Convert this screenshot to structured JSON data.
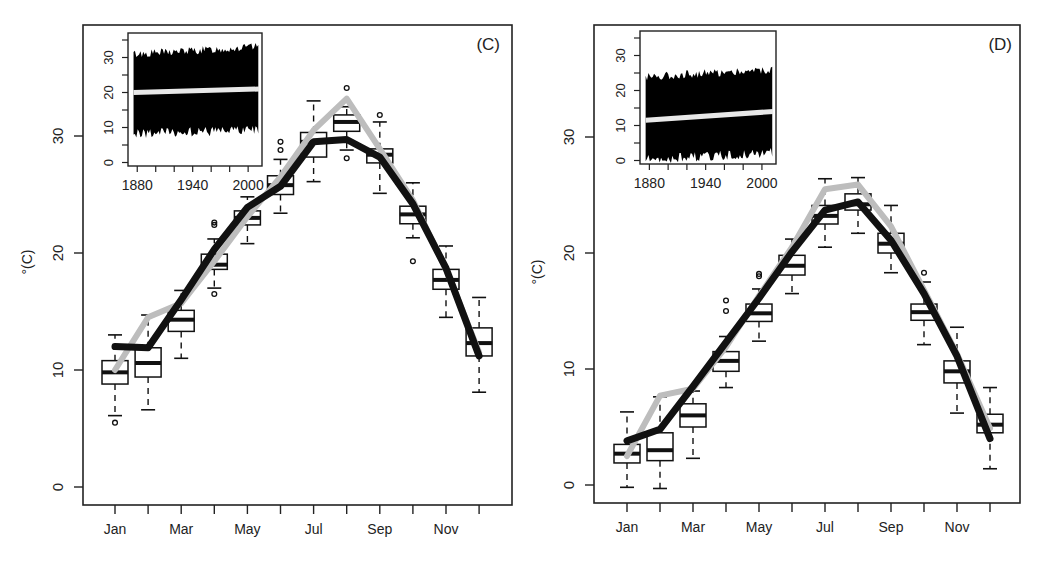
{
  "figure": {
    "panels": [
      "C",
      "D"
    ]
  },
  "colors": {
    "observed_line": "#111111",
    "model_line": "#bdbdbd",
    "box_stroke": "#111111",
    "inset_fill": "#000000",
    "inset_trend": "#e8e8e8"
  },
  "chart_data": [
    {
      "type": "box",
      "panel_label": "(C)",
      "title": "",
      "xlabel": "",
      "ylabel": "°(C)",
      "categories": [
        "Jan",
        "Feb",
        "Mar",
        "Apr",
        "May",
        "Jun",
        "Jul",
        "Aug",
        "Sep",
        "Oct",
        "Nov",
        "Dec"
      ],
      "x_tick_labels": [
        "Jan",
        "Mar",
        "May",
        "Jul",
        "Sep",
        "Nov"
      ],
      "y_ticks": [
        0,
        10,
        20,
        30
      ],
      "ylim": [
        -1.5,
        39.5
      ],
      "grid": false,
      "boxes": [
        {
          "month": "Jan",
          "wlo": 6.1,
          "q1": 8.8,
          "med": 9.8,
          "q3": 10.8,
          "whi": 13.0,
          "outliers": [
            5.5
          ]
        },
        {
          "month": "Feb",
          "wlo": 6.6,
          "q1": 9.4,
          "med": 10.6,
          "q3": 11.9,
          "whi": 14.7,
          "outliers": []
        },
        {
          "month": "Mar",
          "wlo": 11.0,
          "q1": 13.3,
          "med": 14.3,
          "q3": 15.1,
          "whi": 16.8,
          "outliers": []
        },
        {
          "month": "Apr",
          "wlo": 17.0,
          "q1": 18.6,
          "med": 19.0,
          "q3": 19.9,
          "whi": 21.2,
          "outliers": [
            22.6,
            22.4,
            16.5
          ]
        },
        {
          "month": "May",
          "wlo": 20.8,
          "q1": 22.4,
          "med": 23.0,
          "q3": 23.6,
          "whi": 24.8,
          "outliers": []
        },
        {
          "month": "Jun",
          "wlo": 23.4,
          "q1": 25.0,
          "med": 25.8,
          "q3": 26.6,
          "whi": 28.0,
          "outliers": [
            29.5,
            28.8
          ]
        },
        {
          "month": "Jul",
          "wlo": 26.1,
          "q1": 28.2,
          "med": 29.5,
          "q3": 30.3,
          "whi": 33.0,
          "outliers": []
        },
        {
          "month": "Aug",
          "wlo": 28.8,
          "q1": 30.4,
          "med": 31.2,
          "q3": 31.8,
          "whi": 32.5,
          "outliers": [
            34.1,
            28.1
          ]
        },
        {
          "month": "Sep",
          "wlo": 25.1,
          "q1": 27.7,
          "med": 28.4,
          "q3": 28.9,
          "whi": 31.2,
          "outliers": [
            31.8
          ]
        },
        {
          "month": "Oct",
          "wlo": 21.3,
          "q1": 22.5,
          "med": 23.3,
          "q3": 24.0,
          "whi": 26.0,
          "outliers": [
            19.3
          ]
        },
        {
          "month": "Nov",
          "wlo": 14.5,
          "q1": 16.9,
          "med": 17.7,
          "q3": 18.6,
          "whi": 20.6,
          "outliers": []
        },
        {
          "month": "Dec",
          "wlo": 8.1,
          "q1": 11.2,
          "med": 12.3,
          "q3": 13.6,
          "whi": 16.2,
          "outliers": []
        }
      ],
      "series": [
        {
          "name": "black line",
          "color": "#111111",
          "values": [
            12.0,
            11.9,
            16.0,
            20.3,
            23.9,
            25.7,
            29.5,
            29.7,
            28.2,
            24.2,
            18.7,
            11.2
          ]
        },
        {
          "name": "gray line",
          "color": "#bdbdbd",
          "values": [
            10.0,
            14.5,
            15.7,
            19.3,
            23.1,
            26.5,
            30.5,
            33.2,
            28.9,
            24.5,
            18.6,
            11.5
          ]
        }
      ],
      "inset": {
        "type": "line",
        "x_tick_labels": [
          "1880",
          "1940",
          "2000"
        ],
        "x_ticks": [
          1880,
          1900,
          1920,
          1940,
          1960,
          1980,
          2000
        ],
        "y_tick_labels": [
          "0",
          "10",
          "20",
          "30"
        ],
        "y_ticks": [
          0,
          5,
          10,
          15,
          20,
          25,
          30,
          35
        ],
        "xlim": [
          1870,
          2015
        ],
        "ylim": [
          -1,
          37
        ],
        "series_range": {
          "x": [
            1876,
            2012
          ],
          "low_start": 9,
          "low_end": 10,
          "high_start": 31,
          "high_end": 33
        },
        "trend": {
          "x": [
            1876,
            2012
          ],
          "y": [
            20.0,
            21.0
          ]
        }
      }
    },
    {
      "type": "box",
      "panel_label": "(D)",
      "title": "",
      "xlabel": "",
      "ylabel": "°(C)",
      "categories": [
        "Jan",
        "Feb",
        "Mar",
        "Apr",
        "May",
        "Jun",
        "Jul",
        "Aug",
        "Sep",
        "Oct",
        "Nov",
        "Dec"
      ],
      "x_tick_labels": [
        "Jan",
        "Mar",
        "May",
        "Jul",
        "Sep",
        "Nov"
      ],
      "y_ticks": [
        0,
        10,
        20,
        30
      ],
      "ylim": [
        -1.5,
        39.5
      ],
      "grid": false,
      "boxes": [
        {
          "month": "Jan",
          "wlo": -0.2,
          "q1": 1.9,
          "med": 2.7,
          "q3": 3.5,
          "whi": 6.3,
          "outliers": []
        },
        {
          "month": "Feb",
          "wlo": -0.3,
          "q1": 2.1,
          "med": 3.0,
          "q3": 4.5,
          "whi": 7.6,
          "outliers": []
        },
        {
          "month": "Mar",
          "wlo": 2.3,
          "q1": 5.0,
          "med": 6.0,
          "q3": 7.0,
          "whi": 8.1,
          "outliers": []
        },
        {
          "month": "Apr",
          "wlo": 8.4,
          "q1": 9.8,
          "med": 10.7,
          "q3": 11.5,
          "whi": 12.8,
          "outliers": [
            15.0,
            15.9
          ]
        },
        {
          "month": "May",
          "wlo": 12.4,
          "q1": 14.1,
          "med": 14.8,
          "q3": 15.6,
          "whi": 16.9,
          "outliers": [
            18.0,
            18.2
          ]
        },
        {
          "month": "Jun",
          "wlo": 16.5,
          "q1": 18.1,
          "med": 18.9,
          "q3": 19.8,
          "whi": 21.2,
          "outliers": []
        },
        {
          "month": "Jul",
          "wlo": 20.5,
          "q1": 22.5,
          "med": 23.2,
          "q3": 24.1,
          "whi": 26.4,
          "outliers": []
        },
        {
          "month": "Aug",
          "wlo": 21.7,
          "q1": 23.7,
          "med": 24.2,
          "q3": 25.1,
          "whi": 26.5,
          "outliers": []
        },
        {
          "month": "Sep",
          "wlo": 18.3,
          "q1": 20.0,
          "med": 20.8,
          "q3": 21.7,
          "whi": 24.1,
          "outliers": []
        },
        {
          "month": "Oct",
          "wlo": 12.1,
          "q1": 14.2,
          "med": 14.9,
          "q3": 15.6,
          "whi": 17.5,
          "outliers": [
            18.3
          ]
        },
        {
          "month": "Nov",
          "wlo": 6.2,
          "q1": 8.8,
          "med": 9.8,
          "q3": 10.7,
          "whi": 13.6,
          "outliers": []
        },
        {
          "month": "Dec",
          "wlo": 1.4,
          "q1": 4.5,
          "med": 5.2,
          "q3": 6.1,
          "whi": 8.4,
          "outliers": []
        }
      ],
      "series": [
        {
          "name": "black line",
          "color": "#111111",
          "values": [
            3.8,
            4.8,
            8.5,
            12.3,
            16.1,
            20.1,
            23.7,
            24.4,
            21.1,
            16.5,
            11.1,
            4.0
          ]
        },
        {
          "name": "gray line",
          "color": "#bdbdbd",
          "values": [
            2.5,
            7.7,
            8.3,
            11.9,
            16.3,
            20.5,
            25.5,
            25.9,
            22.3,
            16.8,
            11.3,
            4.9
          ]
        }
      ],
      "inset": {
        "type": "line",
        "x_tick_labels": [
          "1880",
          "1940",
          "2000"
        ],
        "x_ticks": [
          1880,
          1900,
          1920,
          1940,
          1960,
          1980,
          2000
        ],
        "y_tick_labels": [
          "0",
          "10",
          "20",
          "30"
        ],
        "y_ticks": [
          0,
          5,
          10,
          15,
          20,
          25,
          30,
          35
        ],
        "xlim": [
          1870,
          2015
        ],
        "ylim": [
          -1,
          37
        ],
        "series_range": {
          "x": [
            1876,
            2012
          ],
          "low_start": 1,
          "low_end": 3,
          "high_start": 24,
          "high_end": 26
        },
        "trend": {
          "x": [
            1876,
            2012
          ],
          "y": [
            11.5,
            14.0
          ]
        }
      }
    }
  ]
}
